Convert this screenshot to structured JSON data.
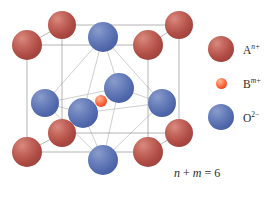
{
  "figure": {
    "type": "crystal-structure-diagram",
    "background": "#ffffff",
    "title": "",
    "formula": {
      "text": "n + m = 6",
      "var1": "n",
      "operator": "+",
      "var2": "m",
      "equals": "=",
      "value": "6"
    },
    "legend": {
      "items": [
        {
          "id": "a-cation",
          "symbol": "A",
          "superscript": "n+",
          "superscript_italic": true,
          "color": "#ad4a43",
          "radius_px": 13,
          "icon": "sphere-icon"
        },
        {
          "id": "b-cation",
          "symbol": "B",
          "superscript": "m+",
          "superscript_italic": true,
          "color": "#f4542c",
          "radius_px": 5,
          "icon": "sphere-icon"
        },
        {
          "id": "oxygen-anion",
          "symbol": "O",
          "superscript": "2−",
          "superscript_italic": false,
          "color": "#4f67ab",
          "radius_px": 13,
          "icon": "sphere-icon"
        }
      ]
    },
    "structure": {
      "cell_edge_color": "#8c8c8c",
      "octahedron_edge_color": "#c8c8c8",
      "cell_edges": [
        {
          "x1": 27,
          "y1": 45,
          "x2": 148,
          "y2": 45
        },
        {
          "x1": 148,
          "y1": 45,
          "x2": 148,
          "y2": 152
        },
        {
          "x1": 148,
          "y1": 152,
          "x2": 27,
          "y2": 152
        },
        {
          "x1": 27,
          "y1": 152,
          "x2": 27,
          "y2": 45
        },
        {
          "x1": 62,
          "y1": 25,
          "x2": 179,
          "y2": 25
        },
        {
          "x1": 179,
          "y1": 25,
          "x2": 179,
          "y2": 133
        },
        {
          "x1": 179,
          "y1": 133,
          "x2": 62,
          "y2": 133
        },
        {
          "x1": 62,
          "y1": 133,
          "x2": 62,
          "y2": 25
        },
        {
          "x1": 27,
          "y1": 45,
          "x2": 62,
          "y2": 25
        },
        {
          "x1": 148,
          "y1": 45,
          "x2": 179,
          "y2": 25
        },
        {
          "x1": 148,
          "y1": 152,
          "x2": 179,
          "y2": 133
        },
        {
          "x1": 27,
          "y1": 152,
          "x2": 62,
          "y2": 133
        }
      ],
      "atoms": [
        {
          "type": "A",
          "cx": 27,
          "cy": 45,
          "r": 15,
          "z": 3,
          "label": "corner-front-top-left"
        },
        {
          "type": "A",
          "cx": 148,
          "cy": 45,
          "r": 15,
          "z": 3,
          "label": "corner-front-top-right"
        },
        {
          "type": "A",
          "cx": 27,
          "cy": 152,
          "r": 15,
          "z": 3,
          "label": "corner-front-bottom-left"
        },
        {
          "type": "A",
          "cx": 148,
          "cy": 152,
          "r": 15,
          "z": 3,
          "label": "corner-front-bottom-right"
        },
        {
          "type": "A",
          "cx": 62,
          "cy": 25,
          "r": 14,
          "z": 1,
          "label": "corner-back-top-left"
        },
        {
          "type": "A",
          "cx": 179,
          "cy": 25,
          "r": 14,
          "z": 1,
          "label": "corner-back-top-right"
        },
        {
          "type": "A",
          "cx": 62,
          "cy": 133,
          "r": 14,
          "z": 1,
          "label": "corner-back-bottom-left"
        },
        {
          "type": "A",
          "cx": 179,
          "cy": 133,
          "r": 14,
          "z": 1,
          "label": "corner-back-bottom-right"
        },
        {
          "type": "O",
          "cx": 103,
          "cy": 37,
          "r": 15,
          "z": 4,
          "label": "face-top"
        },
        {
          "type": "O",
          "cx": 103,
          "cy": 160,
          "r": 15,
          "z": 4,
          "label": "face-bottom"
        },
        {
          "type": "O",
          "cx": 45,
          "cy": 103,
          "r": 14,
          "z": 4,
          "label": "face-left"
        },
        {
          "type": "O",
          "cx": 162,
          "cy": 103,
          "r": 14,
          "z": 4,
          "label": "face-right"
        },
        {
          "type": "O",
          "cx": 119,
          "cy": 88,
          "r": 15,
          "z": 5,
          "label": "face-back"
        },
        {
          "type": "O",
          "cx": 83,
          "cy": 113,
          "r": 15,
          "z": 5,
          "label": "face-front"
        },
        {
          "type": "B",
          "cx": 101,
          "cy": 101,
          "r": 6,
          "z": 6,
          "label": "body-center"
        }
      ],
      "octahedron_edges": [
        {
          "x1": 103,
          "y1": 37,
          "x2": 45,
          "y2": 103
        },
        {
          "x1": 103,
          "y1": 37,
          "x2": 162,
          "y2": 103
        },
        {
          "x1": 103,
          "y1": 37,
          "x2": 119,
          "y2": 88
        },
        {
          "x1": 103,
          "y1": 37,
          "x2": 83,
          "y2": 113
        },
        {
          "x1": 103,
          "y1": 160,
          "x2": 45,
          "y2": 103
        },
        {
          "x1": 103,
          "y1": 160,
          "x2": 162,
          "y2": 103
        },
        {
          "x1": 103,
          "y1": 160,
          "x2": 119,
          "y2": 88
        },
        {
          "x1": 103,
          "y1": 160,
          "x2": 83,
          "y2": 113
        },
        {
          "x1": 45,
          "y1": 103,
          "x2": 119,
          "y2": 88
        },
        {
          "x1": 45,
          "y1": 103,
          "x2": 83,
          "y2": 113
        },
        {
          "x1": 162,
          "y1": 103,
          "x2": 119,
          "y2": 88
        },
        {
          "x1": 162,
          "y1": 103,
          "x2": 83,
          "y2": 113
        }
      ]
    }
  }
}
